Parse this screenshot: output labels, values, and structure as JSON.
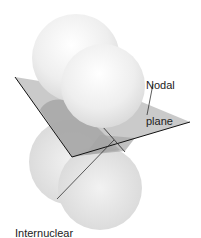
{
  "figure": {
    "type": "pi-orbital-nodal-plane",
    "labels": {
      "nodal_plane": {
        "line1": "Nodal",
        "line2": "plane"
      },
      "internuclear_axis": {
        "line1": "Internuclear",
        "line2": "axis"
      }
    },
    "colors": {
      "background": "#ffffff",
      "lobe_fill": "#e8e8e8",
      "lobe_highlight": "#fafafa",
      "plane_fill": "#bdbdbd",
      "plane_shadow": "#9e9e9e",
      "edge_line": "#111111",
      "text": "#222222"
    }
  }
}
